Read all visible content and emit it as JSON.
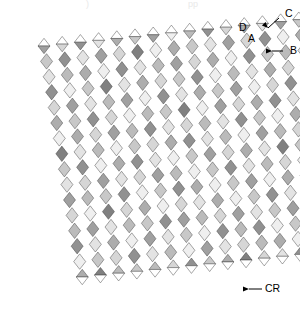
{
  "figure": {
    "kind": "sheared-diamond-lattice-diagram",
    "canvas": {
      "width": 300,
      "height": 321
    },
    "background_color": "#ffffff",
    "outline_color": "#3a3a3a",
    "channel_color": "#ffffff"
  },
  "geometry": {
    "origin": {
      "x": 38,
      "y": 46
    },
    "axis_u": {
      "dx": 15.0,
      "dy": -1.55,
      "label": "band-step-right"
    },
    "axis_v": {
      "dx": 2.55,
      "dy": 15.4,
      "label": "cell-step-down"
    },
    "bands": 16,
    "rows": 16,
    "cells_per_band": 1,
    "channel_width": 3.2,
    "cell_half_width": 6.0
  },
  "palette": {
    "shades": [
      "#6f6f6f",
      "#808080",
      "#919191",
      "#a0a0a0",
      "#adadad",
      "#bbbbbb",
      "#c8c8c8",
      "#d6d6d6",
      "#e3e3e3",
      "#efefef"
    ],
    "dark_accent": "#6f6f6f",
    "light_accent": "#efefef"
  },
  "chart_data": {
    "type": "heatmap",
    "title": "",
    "xlabel": "",
    "ylabel": "",
    "note": "Each value is a grey-level index (0 = darkest, 9 = lightest) for one rhombic cell. Row = position down a diagonal band, column = band index left to right.",
    "levels": 10,
    "columns": 16,
    "rows": 16,
    "values": [
      [
        3,
        7,
        2,
        8,
        4,
        6,
        3,
        9,
        5,
        2,
        7,
        4,
        8,
        3,
        6,
        5
      ],
      [
        6,
        2,
        8,
        3,
        7,
        1,
        9,
        4,
        6,
        8,
        3,
        7,
        2,
        9,
        4,
        7
      ],
      [
        8,
        5,
        4,
        9,
        2,
        8,
        5,
        3,
        7,
        4,
        9,
        2,
        6,
        5,
        8,
        3
      ],
      [
        2,
        9,
        6,
        1,
        8,
        4,
        7,
        6,
        2,
        9,
        5,
        8,
        4,
        7,
        2,
        9
      ],
      [
        7,
        3,
        8,
        5,
        3,
        9,
        2,
        8,
        4,
        6,
        3,
        9,
        7,
        2,
        8,
        4
      ],
      [
        4,
        6,
        2,
        7,
        9,
        5,
        6,
        1,
        9,
        3,
        7,
        4,
        2,
        8,
        5,
        6
      ],
      [
        9,
        4,
        7,
        3,
        5,
        2,
        8,
        7,
        5,
        8,
        2,
        6,
        9,
        4,
        3,
        8
      ],
      [
        1,
        8,
        5,
        9,
        6,
        7,
        4,
        2,
        8,
        5,
        9,
        3,
        5,
        7,
        9,
        2
      ],
      [
        6,
        2,
        9,
        4,
        2,
        8,
        9,
        6,
        3,
        7,
        4,
        8,
        1,
        6,
        4,
        7
      ],
      [
        8,
        7,
        3,
        8,
        7,
        3,
        5,
        9,
        6,
        2,
        8,
        5,
        7,
        9,
        6,
        3
      ],
      [
        3,
        5,
        6,
        2,
        9,
        6,
        2,
        4,
        9,
        6,
        3,
        9,
        4,
        2,
        8,
        5
      ],
      [
        7,
        9,
        1,
        7,
        4,
        9,
        7,
        8,
        4,
        9,
        6,
        2,
        8,
        5,
        1,
        9
      ],
      [
        5,
        3,
        8,
        5,
        6,
        2,
        3,
        5,
        7,
        3,
        8,
        6,
        3,
        7,
        5,
        4
      ],
      [
        2,
        8,
        4,
        9,
        3,
        8,
        6,
        9,
        2,
        5,
        2,
        9,
        6,
        4,
        9,
        7
      ],
      [
        9,
        6,
        7,
        2,
        8,
        5,
        9,
        3,
        8,
        7,
        5,
        4,
        9,
        8,
        3,
        2
      ],
      [
        4,
        1,
        5,
        6,
        5,
        7,
        2,
        6,
        4,
        1,
        7,
        8,
        2,
        6,
        7,
        8
      ]
    ]
  },
  "annotations": [
    {
      "id": "label-c",
      "label": "C",
      "text_x": 285,
      "text_y": 14,
      "leader": {
        "x1": 279,
        "y1": 18,
        "x2": 268,
        "y2": 28
      },
      "arrow_angle": 225,
      "description": "points to an upward triangular half-cell at the top edge"
    },
    {
      "id": "label-d",
      "label": "D",
      "text_x": 239,
      "text_y": 28,
      "leader": null,
      "arrow_angle": 0,
      "description": "marks the white channel between two diagonal bands"
    },
    {
      "id": "label-a",
      "label": "A",
      "text_x": 248,
      "text_y": 39,
      "leader": null,
      "arrow_angle": 0,
      "description": "marks a single rhombic cell"
    },
    {
      "id": "label-b",
      "label": "B",
      "text_x": 290,
      "text_y": 51,
      "leader": {
        "x1": 283,
        "y1": 51,
        "x2": 272,
        "y2": 51
      },
      "arrow_angle": 180,
      "description": "points left at the band width along the right edge"
    },
    {
      "id": "label-cr",
      "label": "CR",
      "text_x": 265,
      "text_y": 289,
      "leader": {
        "x1": 262,
        "y1": 289,
        "x2": 249,
        "y2": 289
      },
      "arrow_angle": 180,
      "description": "points left at a triangular half-cell on the bottom edge"
    }
  ],
  "cropped_header": {
    "left_fragment": ")",
    "right_fragment": "pp"
  }
}
